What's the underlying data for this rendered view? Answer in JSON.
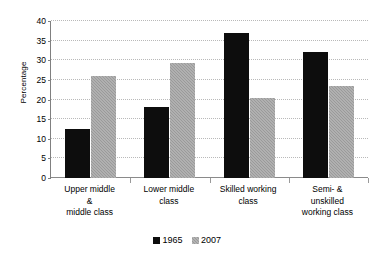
{
  "chart_data": {
    "type": "bar",
    "title": "",
    "xlabel": "",
    "ylabel": "Percentage",
    "ylim": [
      0,
      40
    ],
    "yticks": [
      0,
      5,
      10,
      15,
      20,
      25,
      30,
      35,
      40
    ],
    "ytick_labels": [
      "0",
      "5",
      "10",
      "15",
      "20",
      "25",
      "30",
      "35",
      "40"
    ],
    "grid": true,
    "legend_position": "bottom",
    "categories": [
      "Upper middle & middle class",
      "Lower middle class",
      "Skilled working class",
      "Semi- & unskilled working class"
    ],
    "category_label_lines": [
      [
        "Upper middle",
        "&",
        "middle class"
      ],
      [
        "Lower middle",
        "class"
      ],
      [
        "Skilled working",
        "class"
      ],
      [
        "Semi- &",
        "unskilled",
        "working class"
      ]
    ],
    "series": [
      {
        "name": "1965",
        "color": "#0d0d0d",
        "values": [
          12.5,
          18.0,
          37.0,
          32.0
        ]
      },
      {
        "name": "2007",
        "color": "#9a9a9a",
        "values": [
          26.0,
          29.2,
          20.3,
          23.5
        ]
      }
    ]
  },
  "axis": {
    "y_title": "Percentage"
  },
  "legend": {
    "entries": [
      {
        "label": "1965",
        "swatch": "black-square-swatch"
      },
      {
        "label": "2007",
        "swatch": "gray-square-swatch"
      }
    ]
  }
}
